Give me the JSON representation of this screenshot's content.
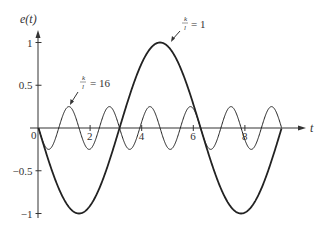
{
  "chart_data": {
    "type": "line",
    "title": "",
    "xlabel": "t",
    "ylabel": "e(t)",
    "xlim": [
      0,
      9.42
    ],
    "ylim": [
      -1,
      1
    ],
    "x_ticks": [
      "0",
      "2",
      "4",
      "6",
      "8"
    ],
    "y_ticks": [
      "1",
      "0.5",
      "-0.5",
      "-1"
    ],
    "grid": false,
    "legend": "none",
    "series": [
      {
        "name": "k/l = 1",
        "formula": "e(t) = -sin(t)",
        "x": [
          0,
          1.571,
          3.142,
          4.712,
          6.283,
          7.854,
          9.425
        ],
        "values": [
          0,
          -1,
          0,
          1,
          0,
          -1,
          0
        ]
      },
      {
        "name": "k/l = 16",
        "formula": "e(t) = -0.25 sin(4t)",
        "x": [
          0,
          0.393,
          0.785,
          1.178,
          1.571,
          1.963,
          2.356,
          2.749,
          3.142
        ],
        "values": [
          0,
          -0.25,
          0,
          0.25,
          0,
          -0.25,
          0,
          0.25,
          0
        ]
      }
    ],
    "annotations": [
      {
        "text_num": "k",
        "text_den": "l",
        "text_rhs": "= 1",
        "target": "k/l = 1 curve peak"
      },
      {
        "text_num": "k",
        "text_den": "l",
        "text_rhs": "= 16",
        "target": "k/l = 16 curve"
      }
    ]
  },
  "axes": {
    "y_label": "e(t)",
    "x_label": "t",
    "origin_label": "0"
  }
}
